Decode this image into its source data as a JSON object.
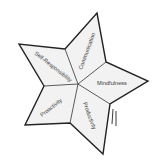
{
  "diagram": {
    "type": "star",
    "segments": [
      {
        "label": "Self-Responsibility"
      },
      {
        "label": "Communication"
      },
      {
        "label": "Mindfulness"
      },
      {
        "label": "Productivity"
      },
      {
        "label": "Proactivity"
      }
    ],
    "colors": {
      "fill": "#f2f2f2",
      "stroke": "#222222",
      "text": "#3a3a3a"
    }
  }
}
